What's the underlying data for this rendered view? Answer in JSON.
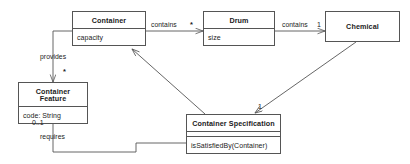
{
  "diagram": {
    "type": "uml-class-diagram",
    "stroke_color": "#555555",
    "text_color": "#1b1b1b",
    "background_color": "#ffffff",
    "classes": [
      {
        "id": "container",
        "name": "Container",
        "attributes": "capacity",
        "operations": ""
      },
      {
        "id": "drum",
        "name": "Drum",
        "attributes": "size",
        "operations": ""
      },
      {
        "id": "chemical",
        "name": "Chemical",
        "attributes": "",
        "operations": ""
      },
      {
        "id": "container_feature",
        "name": "Container Feature",
        "attributes": "code: String",
        "operations": ""
      },
      {
        "id": "container_specification",
        "name": "Container Specification",
        "attributes": "",
        "operations": "isSatisfiedBy(Container)"
      }
    ],
    "associations": [
      {
        "id": "container_contains_drum",
        "label": "contains",
        "multiplicity": "*",
        "source": "Container",
        "target": "Drum"
      },
      {
        "id": "drum_contains_chemical",
        "label": "contains",
        "multiplicity": "1",
        "source": "Drum",
        "target": "Chemical"
      },
      {
        "id": "container_provides_feature",
        "label": "provides",
        "multiplicity": "*",
        "source": "Container",
        "target": "Container Feature"
      },
      {
        "id": "spec_requires_feature",
        "label": "requires",
        "multiplicity": "0..1",
        "source": "Container Specification",
        "target": "Container Feature"
      },
      {
        "id": "chemical_spec",
        "label": "",
        "multiplicity": "1",
        "source": "Chemical",
        "target": "Container Specification"
      },
      {
        "id": "spec_container",
        "label": "",
        "multiplicity": "",
        "source": "Container Specification",
        "target": "Container"
      }
    ]
  }
}
